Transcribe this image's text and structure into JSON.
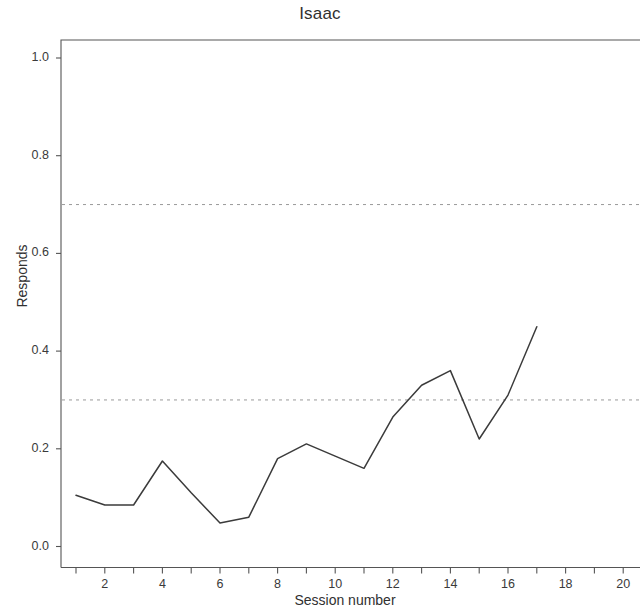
{
  "chart_data": {
    "type": "line",
    "title": "Isaac",
    "xlabel": "Session number",
    "ylabel": "Responds",
    "x": [
      1,
      2,
      3,
      4,
      5,
      6,
      7,
      8,
      9,
      10,
      11,
      12,
      13,
      14,
      15,
      16,
      17
    ],
    "values": [
      0.105,
      0.085,
      0.085,
      0.175,
      0.11,
      0.048,
      0.06,
      0.18,
      0.21,
      0.185,
      0.16,
      0.265,
      0.33,
      0.36,
      0.22,
      0.31,
      0.45
    ],
    "series": [
      {
        "name": "Responds",
        "values": [
          0.105,
          0.085,
          0.085,
          0.175,
          0.11,
          0.048,
          0.06,
          0.18,
          0.21,
          0.185,
          0.16,
          0.265,
          0.33,
          0.36,
          0.22,
          0.31,
          0.45
        ]
      }
    ],
    "xlim": [
      0.5,
      20.5
    ],
    "ylim": [
      -0.04,
      1.06
    ],
    "ytick_labels": [
      "0.0",
      "0.2",
      "0.4",
      "0.6",
      "0.8",
      "1.0"
    ],
    "ytick_values": [
      0.0,
      0.2,
      0.4,
      0.6,
      0.8,
      1.0
    ],
    "xtick_labels": [
      "2",
      "4",
      "6",
      "8",
      "10",
      "12",
      "14",
      "16",
      "18",
      "20"
    ],
    "xtick_values": [
      2,
      4,
      6,
      8,
      10,
      12,
      14,
      16,
      18,
      20
    ],
    "xminor_tick_values": [
      1,
      3,
      5,
      7,
      9,
      11,
      13,
      15,
      17,
      19
    ],
    "reference_lines": [
      {
        "name": "upper-criterion",
        "value": 0.7,
        "style": "dashed"
      },
      {
        "name": "lower-criterion",
        "value": 0.3,
        "style": "dashed"
      }
    ],
    "grid": false,
    "legend": "none",
    "line_color": "#3b3b3b",
    "reference_line_color": "#9a9a9a",
    "axis_color": "#555555"
  }
}
